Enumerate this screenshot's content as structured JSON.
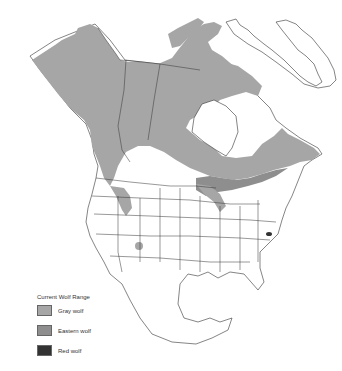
{
  "map": {
    "title": "North America wolf range map",
    "region": "North America"
  },
  "legend": {
    "title": "Current Wolf Range",
    "items": [
      {
        "label": "Gray wolf",
        "color": "#a6a6a6"
      },
      {
        "label": "Eastern wolf",
        "color": "#8e8e8e"
      },
      {
        "label": "Red wolf",
        "color": "#333333"
      }
    ]
  }
}
